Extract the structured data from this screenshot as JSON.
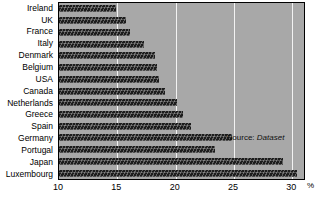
{
  "chart_data": {
    "type": "bar",
    "orientation": "horizontal",
    "title": "",
    "xlabel": "%",
    "ylabel": "",
    "xlim": [
      10,
      31
    ],
    "grid": true,
    "gridlines": [
      15,
      20,
      25,
      30
    ],
    "legend": null,
    "categories": [
      "Ireland",
      "UK",
      "France",
      "Italy",
      "Denmark",
      "Belgium",
      "USA",
      "Canada",
      "Netherlands",
      "Greece",
      "Spain",
      "Germany",
      "Portugal",
      "Japan",
      "Luxembourg"
    ],
    "values": [
      14.9,
      15.7,
      16.1,
      17.3,
      18.2,
      18.4,
      18.6,
      19.1,
      20.1,
      20.6,
      21.3,
      24.8,
      23.4,
      29.2,
      30.4
    ],
    "xticks": [
      10,
      15,
      20,
      25,
      30
    ],
    "xticklabels": [
      "10",
      "15",
      "20",
      "25",
      "30"
    ],
    "annotations": [
      {
        "name": "source-note",
        "prefix": "Source: ",
        "value": "Dataset"
      }
    ],
    "colors": {
      "plot_background": "#a8a8a8",
      "bar": "#1c1c1c",
      "gridline": "#f2f2f2",
      "axis": "#000000",
      "page_background": "#ffffff"
    }
  }
}
